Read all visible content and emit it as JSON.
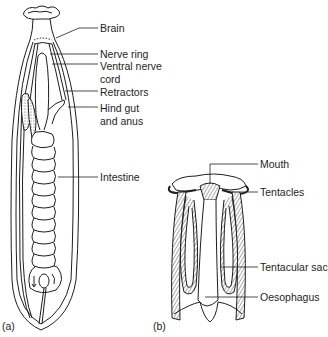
{
  "figure": {
    "panels": [
      {
        "id": "a",
        "tag": "(a)",
        "labels": [
          {
            "text": "Brain"
          },
          {
            "text": "Nerve ring"
          },
          {
            "text": "Ventral nerve"
          },
          {
            "text": "cord"
          },
          {
            "text": "Retractors"
          },
          {
            "text": "Hind gut"
          },
          {
            "text": "and anus"
          },
          {
            "text": "Intestine"
          }
        ]
      },
      {
        "id": "b",
        "tag": "(b)",
        "labels": [
          {
            "text": "Mouth"
          },
          {
            "text": "Tentacles"
          },
          {
            "text": "Tentacular sac"
          },
          {
            "text": "Oesophagus"
          }
        ]
      }
    ],
    "colors": {
      "ink": "#1e1e1e",
      "background": "#ffffff",
      "stipple": "#8a8a8a"
    }
  }
}
